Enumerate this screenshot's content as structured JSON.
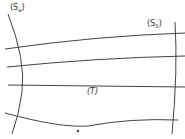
{
  "diagram": {
    "labels": {
      "left_surface": {
        "main": "(S",
        "sub": "a",
        "close": ")"
      },
      "right_surface": {
        "main": "(S",
        "sub": "S",
        "close": ")"
      },
      "trajectory": "(T)"
    },
    "colors": {
      "line": "#444444",
      "text": "#333333",
      "background": "#ffffff"
    },
    "elements": {
      "left_boundary_curve": "curved boundary surface S_a",
      "right_boundary_curve": "near-vertical boundary surface S_S",
      "horizontal_lines": 4,
      "marker_dot": "point"
    }
  }
}
